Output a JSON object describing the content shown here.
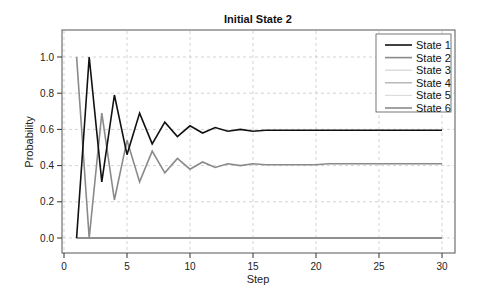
{
  "chart_data": {
    "type": "line",
    "title": "Initial State 2",
    "xlabel": "Step",
    "ylabel": "Probability",
    "xlim": [
      0,
      31
    ],
    "ylim": [
      -0.1,
      1.1
    ],
    "x_ticks": [
      0,
      5,
      10,
      15,
      20,
      25,
      30
    ],
    "y_ticks": [
      0.0,
      0.2,
      0.4,
      0.6,
      0.8,
      1.0
    ],
    "y_tick_labels": [
      "0.0",
      "0.2",
      "0.4",
      "0.6",
      "0.8",
      "1.0"
    ],
    "grid": true,
    "legend_position": "upper right",
    "x": [
      1,
      2,
      3,
      4,
      5,
      6,
      7,
      8,
      9,
      10,
      11,
      12,
      13,
      14,
      15,
      16,
      17,
      18,
      19,
      20,
      21,
      22,
      23,
      24,
      25,
      26,
      27,
      28,
      29,
      30
    ],
    "series": [
      {
        "name": "State 1",
        "color": "#111111",
        "width": 1.6,
        "values": [
          0.0,
          1.0,
          0.31,
          0.79,
          0.46,
          0.69,
          0.52,
          0.64,
          0.56,
          0.62,
          0.58,
          0.61,
          0.59,
          0.6,
          0.59,
          0.595,
          0.595,
          0.595,
          0.595,
          0.595,
          0.595,
          0.595,
          0.595,
          0.595,
          0.595,
          0.595,
          0.595,
          0.595,
          0.595,
          0.595
        ]
      },
      {
        "name": "State 2",
        "color": "#8a8a8a",
        "width": 1.6,
        "values": [
          1.0,
          0.0,
          0.69,
          0.21,
          0.54,
          0.31,
          0.48,
          0.36,
          0.44,
          0.38,
          0.42,
          0.39,
          0.41,
          0.4,
          0.41,
          0.405,
          0.405,
          0.405,
          0.405,
          0.405,
          0.41,
          0.41,
          0.41,
          0.41,
          0.41,
          0.41,
          0.41,
          0.41,
          0.41,
          0.41
        ]
      },
      {
        "name": "State 3",
        "color": "#d4d4d4",
        "width": 1.2,
        "values": [
          0,
          0,
          0,
          0,
          0,
          0,
          0,
          0,
          0,
          0,
          0,
          0,
          0,
          0,
          0,
          0,
          0,
          0,
          0,
          0,
          0,
          0,
          0,
          0,
          0,
          0,
          0,
          0,
          0,
          0
        ]
      },
      {
        "name": "State 4",
        "color": "#a6a6a6",
        "width": 1.2,
        "values": [
          0,
          0,
          0,
          0,
          0,
          0,
          0,
          0,
          0,
          0,
          0,
          0,
          0,
          0,
          0,
          0,
          0,
          0,
          0,
          0,
          0,
          0,
          0,
          0,
          0,
          0,
          0,
          0,
          0,
          0
        ]
      },
      {
        "name": "State 5",
        "color": "#dcdcdc",
        "width": 1.2,
        "values": [
          0,
          0,
          0,
          0,
          0,
          0,
          0,
          0,
          0,
          0,
          0,
          0,
          0,
          0,
          0,
          0,
          0,
          0,
          0,
          0,
          0,
          0,
          0,
          0,
          0,
          0,
          0,
          0,
          0,
          0
        ]
      },
      {
        "name": "State 6",
        "color": "#7a7a7a",
        "width": 1.4,
        "values": [
          0,
          0,
          0,
          0,
          0,
          0,
          0,
          0,
          0,
          0,
          0,
          0,
          0,
          0,
          0,
          0,
          0,
          0,
          0,
          0,
          0,
          0,
          0,
          0,
          0,
          0,
          0,
          0,
          0,
          0
        ]
      }
    ]
  }
}
